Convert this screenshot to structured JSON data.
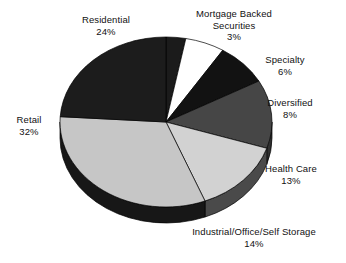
{
  "chart_data": {
    "type": "pie",
    "title": "",
    "subtitle": "",
    "xlabel": "",
    "ylabel": "",
    "legend_position": "none",
    "grid": false,
    "three_d": true,
    "start_angle_deg": 90,
    "direction": "clockwise",
    "units": "percent",
    "categories": [
      "Mortgage Backed Securities",
      "Specialty",
      "Diversified",
      "Health Care",
      "Industrial/Office/Self Storage",
      "Retail",
      "Residential"
    ],
    "values": [
      3,
      6,
      8,
      13,
      14,
      32,
      24
    ],
    "slices": [
      {
        "name": "Mortgage Backed Securities",
        "label_line1": "Mortgage Backed",
        "label_line2": "Securities",
        "value": 3,
        "percent_label": "3%",
        "color": "#1b1b1b",
        "side_color": "#101010"
      },
      {
        "name": "Specialty",
        "label_line1": "Specialty",
        "label_line2": "",
        "value": 6,
        "percent_label": "6%",
        "color": "#ffffff",
        "side_color": "#e8e8e8"
      },
      {
        "name": "Diversified",
        "label_line1": "Diversified",
        "label_line2": "",
        "value": 8,
        "percent_label": "8%",
        "color": "#121212",
        "side_color": "#080808"
      },
      {
        "name": "Health Care",
        "label_line1": "Health Care",
        "label_line2": "",
        "value": 13,
        "percent_label": "13%",
        "color": "#464646",
        "side_color": "#303030"
      },
      {
        "name": "Industrial/Office/Self Storage",
        "label_line1": "Industrial/Office/Self Storage",
        "label_line2": "",
        "value": 14,
        "percent_label": "14%",
        "color": "#d2d2d2",
        "side_color": "#4a4a4a"
      },
      {
        "name": "Retail",
        "label_line1": "Retail",
        "label_line2": "",
        "value": 32,
        "percent_label": "32%",
        "color": "#c6c6c6",
        "side_color": "#171717"
      },
      {
        "name": "Residential",
        "label_line1": "Residential",
        "label_line2": "",
        "value": 24,
        "percent_label": "24%",
        "color": "#1c1c1c",
        "side_color": "#101010"
      }
    ],
    "geometry": {
      "cx": 166,
      "cy": 122,
      "rx": 106,
      "ry": 85,
      "depth": 16
    },
    "colors": {
      "background": "#ffffff",
      "text": "#111111",
      "outline": "#000000"
    }
  }
}
